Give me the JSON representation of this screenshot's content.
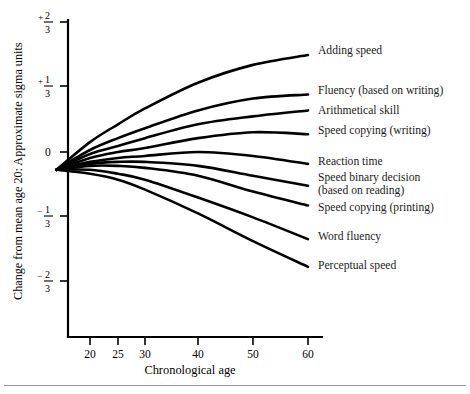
{
  "figure": {
    "background_color": "#ffffff",
    "ink_color": "#000000",
    "rule_color": "#9a9a9a"
  },
  "axes": {
    "x_title": "Chronological age",
    "y_title_full": "Change from mean age 20: Approximate sigma units",
    "y_title_part_a": "Change from mean age 20:",
    "y_title_part_b": "Approximate sigma units",
    "x_ticks": [
      {
        "label": "20",
        "value": 20,
        "px": 90
      },
      {
        "label": "25",
        "value": 25,
        "px": 118
      },
      {
        "label": "30",
        "value": 30,
        "px": 145
      },
      {
        "label": "40",
        "value": 40,
        "px": 198
      },
      {
        "label": "50",
        "value": 50,
        "px": 253
      },
      {
        "label": "60",
        "value": 60,
        "px": 308
      }
    ],
    "y_ticks": [
      {
        "label": "+2/3",
        "sign": "+",
        "numer": "2",
        "denom": "3",
        "value": 0.6667,
        "px": 22
      },
      {
        "label": "+1/3",
        "sign": "+",
        "numer": "1",
        "denom": "3",
        "value": 0.3333,
        "px": 86
      },
      {
        "label": "0",
        "sign": "",
        "numer": "0",
        "denom": "",
        "value": 0,
        "px": 152
      },
      {
        "label": "-1/3",
        "sign": "−",
        "numer": "1",
        "denom": "3",
        "value": -0.3333,
        "px": 216
      },
      {
        "label": "-2/3",
        "sign": "−",
        "numer": "2",
        "denom": "3",
        "value": -0.6667,
        "px": 281
      }
    ]
  },
  "chart_data": {
    "type": "line",
    "title": "",
    "xlabel": "Chronological age",
    "ylabel": "Change from mean age 20: Approximate sigma units",
    "xlim": [
      14,
      60
    ],
    "ylim": [
      -0.8,
      0.7
    ],
    "grid": false,
    "legend": "right-inline-labels",
    "x": [
      14,
      20,
      25,
      30,
      40,
      50,
      60
    ],
    "series": [
      {
        "name": "Adding speed",
        "values": [
          -0.09,
          0.05,
          0.14,
          0.22,
          0.35,
          0.44,
          0.49
        ],
        "end_value": 0.49
      },
      {
        "name": "Fluency (based on writing)",
        "values": [
          -0.09,
          0.01,
          0.07,
          0.12,
          0.21,
          0.27,
          0.29
        ],
        "end_value": 0.29
      },
      {
        "name": "Arithmetical skill",
        "values": [
          -0.09,
          -0.01,
          0.03,
          0.07,
          0.14,
          0.18,
          0.21
        ],
        "end_value": 0.21
      },
      {
        "name": "Speed copying (writing)",
        "values": [
          -0.09,
          -0.03,
          0.0,
          0.02,
          0.07,
          0.1,
          0.09
        ],
        "end_value": 0.09
      },
      {
        "name": "Reaction time",
        "values": [
          -0.09,
          -0.05,
          -0.03,
          -0.02,
          0.0,
          -0.02,
          -0.06
        ],
        "end_value": -0.06
      },
      {
        "name": "Speed binary decision (based on reading)",
        "values": [
          -0.09,
          -0.06,
          -0.05,
          -0.05,
          -0.07,
          -0.12,
          -0.17
        ],
        "end_value": -0.17
      },
      {
        "name": "Speed copying (printing)",
        "values": [
          -0.09,
          -0.07,
          -0.07,
          -0.08,
          -0.12,
          -0.2,
          -0.27
        ],
        "end_value": -0.27
      },
      {
        "name": "Word fluency",
        "values": [
          -0.09,
          -0.09,
          -0.11,
          -0.14,
          -0.23,
          -0.33,
          -0.44
        ],
        "end_value": -0.44
      },
      {
        "name": "Perceptual speed",
        "values": [
          -0.09,
          -0.11,
          -0.14,
          -0.19,
          -0.31,
          -0.45,
          -0.58
        ],
        "end_value": -0.58
      }
    ]
  },
  "series_labels": [
    {
      "text": "Adding speed",
      "x": 318,
      "y": 54
    },
    {
      "text": "Fluency (based on writing)",
      "x": 318,
      "y": 94
    },
    {
      "text": "Arithmetical skill",
      "x": 318,
      "y": 114
    },
    {
      "text": "Speed copying (writing)",
      "x": 318,
      "y": 134
    },
    {
      "text": "Reaction time",
      "x": 318,
      "y": 165
    },
    {
      "text": "Speed binary decision",
      "x": 318,
      "y": 181
    },
    {
      "text": "(based on reading)",
      "x": 318,
      "y": 194
    },
    {
      "text": "Speed copying (printing)",
      "x": 318,
      "y": 211
    },
    {
      "text": "Word fluency",
      "x": 318,
      "y": 240
    },
    {
      "text": "Perceptual speed",
      "x": 318,
      "y": 269
    }
  ]
}
